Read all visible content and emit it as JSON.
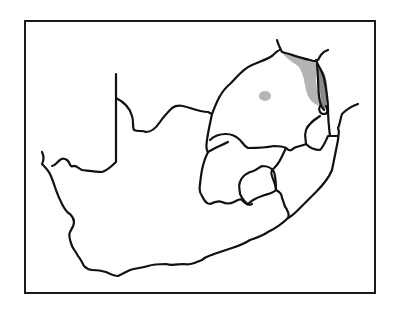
{
  "map": {
    "subject": "South Africa provincial outline with species distribution",
    "colors": {
      "background": "#ffffff",
      "outline": "#111111",
      "distribution_light": "#b4b4b4",
      "distribution_dark": "#8a8a8a"
    },
    "regions": [
      {
        "name": "range-northeast-escarpment",
        "shade": "light"
      },
      {
        "name": "range-kruger-strip",
        "shade": "dark"
      },
      {
        "name": "range-isolated-patch",
        "shade": "light"
      }
    ]
  }
}
